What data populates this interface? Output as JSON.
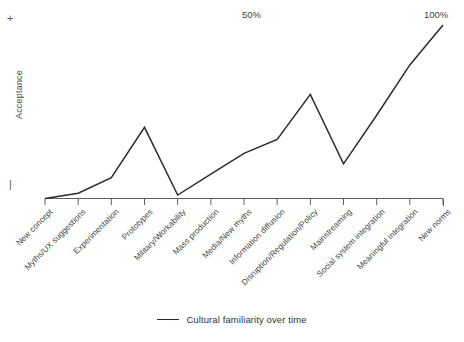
{
  "chart_data": {
    "type": "line",
    "title": "",
    "xlabel": "",
    "ylabel": "Acceptance",
    "grid": false,
    "legend_position": "bottom-center",
    "axis": {
      "y_top_marker": "+",
      "y_bottom_marker": "|",
      "x_min_index": 0,
      "x_max_index": 11
    },
    "categories": [
      "New concept",
      "Myths/UX suggestions",
      "Experimentation",
      "Prototypes",
      "Military/Workability",
      "Mass production",
      "Media/New myths",
      "Information diffusion",
      "Disruption/Regulation/Policy",
      "Mainstreaming",
      "Social system integration",
      "Meaningful integration",
      "New norms"
    ],
    "series": [
      {
        "name": "Cultural familiarity over time",
        "color": "#2b2b2b",
        "values": [
          0,
          3,
          12,
          41,
          2,
          14,
          26,
          34,
          60,
          20,
          48,
          77,
          100
        ]
      }
    ],
    "annotations": [
      {
        "text": "50%",
        "x_index": 6.4,
        "value": 100
      },
      {
        "text": "100%",
        "x_index": 12.0,
        "value": 105
      }
    ]
  },
  "legend": {
    "label": "Cultural familiarity over time"
  },
  "y_axis": {
    "title": "Acceptance",
    "positive_marker": "+",
    "negative_marker": "|"
  },
  "annotations": {
    "mid": "50%",
    "end": "100%"
  }
}
